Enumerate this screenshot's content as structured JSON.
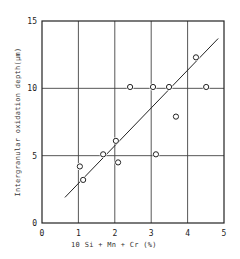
{
  "chart_data": {
    "type": "scatter",
    "title": "",
    "xlabel": "10 Si + Mn + Cr (%)",
    "ylabel": "Intergranular oxidation depth(μm)",
    "xlim": [
      0,
      5
    ],
    "ylim": [
      0,
      15
    ],
    "xticks": [
      "0",
      "1",
      "2",
      "3",
      "4",
      "5"
    ],
    "yticks": [
      "0",
      "5",
      "10",
      "15"
    ],
    "grid": true,
    "legend": null,
    "series": [
      {
        "name": "measured",
        "marker": "open-circle",
        "points": [
          {
            "x": 1.04,
            "y": 4.2
          },
          {
            "x": 1.13,
            "y": 3.2
          },
          {
            "x": 1.68,
            "y": 5.1
          },
          {
            "x": 2.03,
            "y": 6.1
          },
          {
            "x": 2.09,
            "y": 4.5
          },
          {
            "x": 2.42,
            "y": 10.1
          },
          {
            "x": 3.05,
            "y": 10.1
          },
          {
            "x": 3.13,
            "y": 5.1
          },
          {
            "x": 3.49,
            "y": 10.1
          },
          {
            "x": 3.68,
            "y": 7.9
          },
          {
            "x": 4.23,
            "y": 12.3
          },
          {
            "x": 4.51,
            "y": 10.1
          }
        ]
      }
    ],
    "fit_line": {
      "x1": 0.63,
      "y1": 1.9,
      "x2": 4.84,
      "y2": 13.7
    },
    "colors": {
      "ink": "#222222",
      "grid": "#444444",
      "background": "#ffffff"
    }
  }
}
